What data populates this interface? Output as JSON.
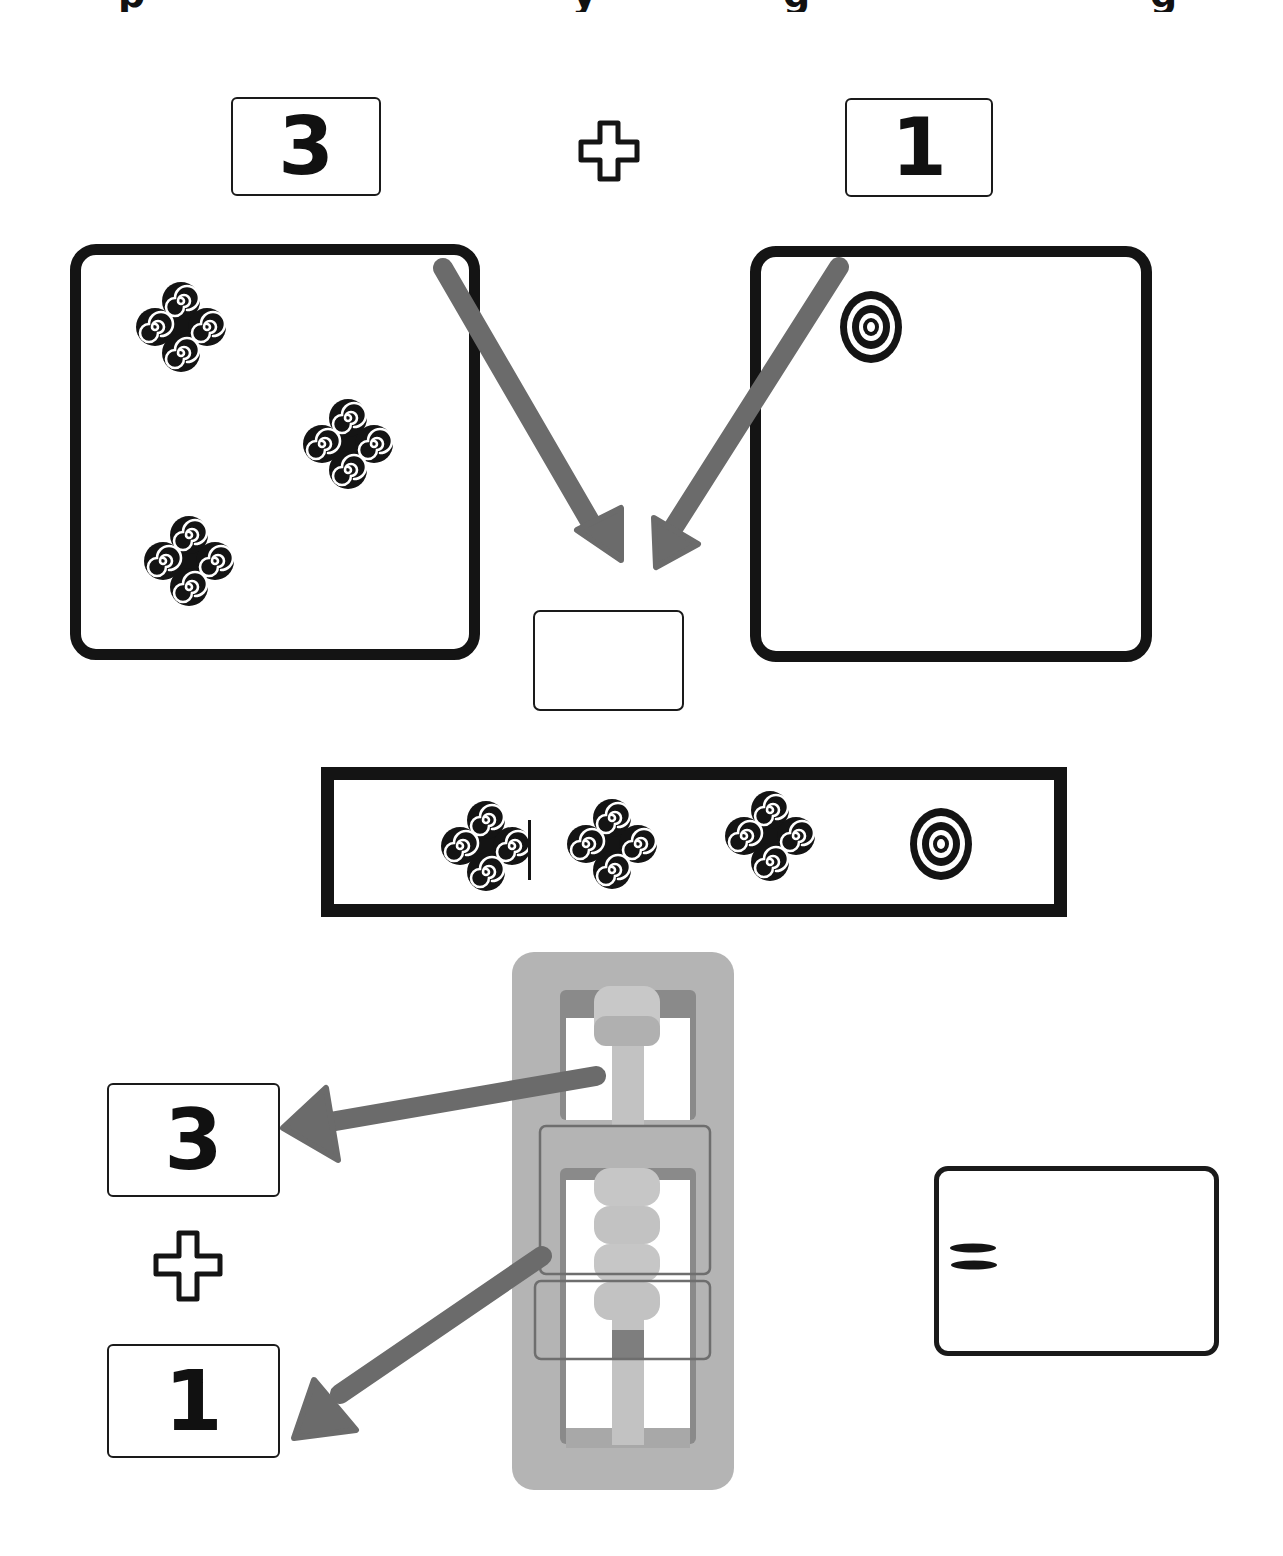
{
  "top_equation": {
    "left_number": "3",
    "operator": "plus",
    "right_number": "1"
  },
  "left_set": {
    "symbol": "four-spiral-symbol",
    "count": 3
  },
  "right_set": {
    "symbol": "concentric-circle-symbol",
    "count": 1
  },
  "result_card": {
    "value": ""
  },
  "combined_strip": {
    "symbols": [
      "four-spiral-symbol",
      "four-spiral-symbol",
      "four-spiral-symbol",
      "concentric-circle-symbol"
    ]
  },
  "abacus": {
    "top_beads": 1,
    "middle_highlight_beads": 3,
    "bottom_highlight_beads": 1
  },
  "bottom_equation": {
    "first_number": "3",
    "operator": "plus",
    "second_number": "1"
  },
  "equals_card": {
    "symbol": "=",
    "value": ""
  },
  "colors": {
    "ink": "#141414",
    "arrow": "#6b6b6b",
    "abacus_frame": "#b4b4b4",
    "abacus_shadow": "#7a7a7a",
    "bead": "#c8c8c8",
    "background": "#ffffff"
  }
}
